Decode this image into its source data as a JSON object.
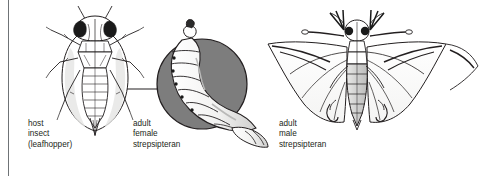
{
  "figure": {
    "background_color": "#ffffff",
    "rule_color": "#6f7376",
    "ink_color": "#231f20",
    "inset_circle_color": "#7d7d7d"
  },
  "labels": {
    "host": {
      "line1": "host",
      "line2": "insect",
      "line3": "(leafhopper)"
    },
    "female": {
      "line1": "adult",
      "line2": "female",
      "line3": "strepsipteran"
    },
    "male": {
      "line1": "adult",
      "line2": "male",
      "line3": "strepsipteran"
    }
  },
  "illustrations": {
    "leafhopper": "dorsal-view-leafhopper-line-drawing",
    "female_inset": "magnified-female-strepsipteran-in-gray-circle",
    "male": "dorsal-view-male-strepsipteran-with-fan-wings",
    "leader_line": "leader-line-from-host-abdomen-to-inset"
  }
}
